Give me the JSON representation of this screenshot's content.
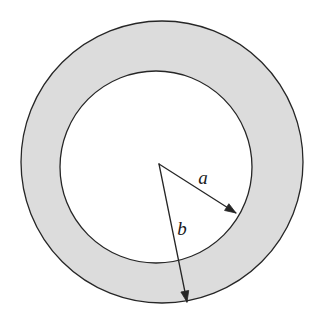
{
  "figure": {
    "kind": "annulus-diagram",
    "background_color": "#ffffff",
    "ring_fill_color": "#dcdcdc",
    "inner_disk_color": "#ffffff",
    "stroke_color": "#262626",
    "stroke_width": 1.3,
    "outer_circle": {
      "cx": 162,
      "cy": 162,
      "r": 141
    },
    "inner_circle": {
      "cx": 156,
      "cy": 167,
      "r": 96
    },
    "vertex": {
      "x": 159,
      "y": 164
    },
    "arrows": [
      {
        "name": "radius-a",
        "label": "a",
        "from": {
          "x": 159,
          "y": 164
        },
        "to": {
          "x": 236,
          "y": 213
        },
        "label_pos": {
          "x": 203,
          "y": 184
        },
        "label_font_size": 19
      },
      {
        "name": "radius-b",
        "label": "b",
        "from": {
          "x": 159,
          "y": 164
        },
        "to": {
          "x": 187,
          "y": 302
        },
        "label_pos": {
          "x": 182,
          "y": 235
        },
        "label_font_size": 19
      }
    ],
    "arrowhead": {
      "length": 11,
      "half_width": 4
    }
  }
}
